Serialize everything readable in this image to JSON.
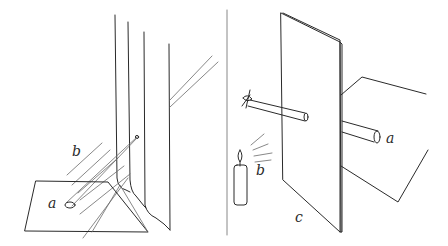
{
  "figure": {
    "left_panel": {
      "labels": {
        "spot": "a",
        "rays": "b"
      },
      "description": "Light passes through a small hole in hanging curtains, forming a spot on a sheet below"
    },
    "right_panel": {
      "labels": {
        "hole_image": "a",
        "rays": "b",
        "screen": "c"
      },
      "description": "Candle light passes through a tube in a board (screen) to a sheet behind"
    }
  }
}
